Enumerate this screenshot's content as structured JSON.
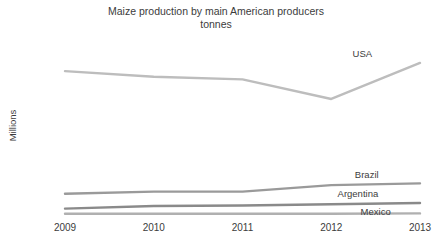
{
  "chart_data": {
    "type": "line",
    "title": "Maize production by main American producers\ntonnes",
    "title_line1": "Maize production by main American producers",
    "title_line2": "tonnes",
    "xlabel": "",
    "ylabel": "Millions",
    "categories": [
      "2009",
      "2010",
      "2011",
      "2012",
      "2013"
    ],
    "x": [
      2009,
      2010,
      2011,
      2012,
      2013
    ],
    "ylim": [
      0,
      400
    ],
    "ytick_values": [
      0,
      50,
      100,
      150,
      200,
      250,
      300,
      350,
      400
    ],
    "ytick_labels": [
      "0",
      "50",
      "100",
      "150",
      "200",
      "250",
      "300",
      "350",
      "400"
    ],
    "grid": true,
    "legend_position": "end-of-line labels",
    "series": [
      {
        "name": "USA",
        "values": [
          333,
          320,
          314,
          269,
          352
        ],
        "color": "#bdbdbd",
        "label_x": 2012.35,
        "label_y": 375
      },
      {
        "name": "Brazil",
        "values": [
          51,
          56,
          56,
          71,
          75
        ],
        "color": "#9a9a9a",
        "label_x": 2012.4,
        "label_y": 97
      },
      {
        "name": "Argentina",
        "values": [
          17,
          23,
          24,
          27,
          30
        ],
        "color": "#8a8a8a",
        "label_x": 2012.3,
        "label_y": 52
      },
      {
        "name": "Mexico",
        "values": [
          5,
          5,
          5,
          5,
          6
        ],
        "color": "#b0b0b0",
        "label_x": 2012.5,
        "label_y": 11
      }
    ]
  }
}
